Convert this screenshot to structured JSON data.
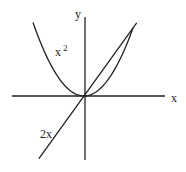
{
  "chart_data": {
    "type": "line",
    "title": "",
    "xlabel": "x",
    "ylabel": "y",
    "xlim": [
      -1.85,
      3.3
    ],
    "ylim": [
      -3.75,
      4.6
    ],
    "grid": false,
    "series": [
      {
        "name": "x²",
        "label": "x",
        "label_sup": "2",
        "function": "x^2",
        "domain": [
          -2.08,
          2.0
        ]
      },
      {
        "name": "2x",
        "label": "2x",
        "function": "2*x",
        "domain": [
          -1.84,
          2.15
        ]
      }
    ],
    "intersections": [
      [
        0,
        0
      ],
      [
        2,
        4
      ]
    ]
  },
  "labels": {
    "x_axis": "x",
    "y_axis": "y",
    "parabola": "x",
    "parabola_sup": "2",
    "line": "2x"
  }
}
